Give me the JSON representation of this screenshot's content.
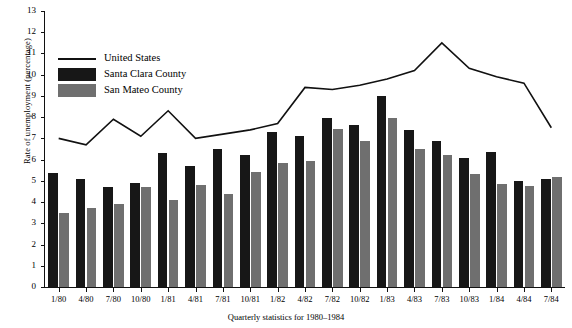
{
  "chart_data": {
    "type": "bar",
    "title": "",
    "xlabel": "Quarterly statistics for 1980–1984",
    "ylabel": "Rate of unemployment (percentage)",
    "ylim": [
      0,
      13
    ],
    "yticks": [
      0,
      1,
      2,
      3,
      4,
      5,
      6,
      7,
      8,
      9,
      10,
      11,
      12,
      13
    ],
    "grid": false,
    "legend_position": "top-left",
    "categories": [
      "1/80",
      "4/80",
      "7/80",
      "10/80",
      "1/81",
      "4/81",
      "7/81",
      "10/81",
      "1/82",
      "4/82",
      "7/82",
      "10/82",
      "1/83",
      "4/83",
      "7/83",
      "10/83",
      "1/84",
      "4/84",
      "7/84"
    ],
    "series": [
      {
        "name": "United States",
        "kind": "line",
        "color": "#111111",
        "values": [
          7.0,
          6.7,
          7.9,
          7.1,
          8.3,
          7.0,
          7.2,
          7.4,
          7.7,
          9.4,
          9.3,
          9.5,
          9.8,
          10.2,
          11.5,
          10.3,
          9.9,
          9.6,
          7.5
        ]
      },
      {
        "name": "Santa Clara County",
        "kind": "bar",
        "color": "#171717",
        "values": [
          5.35,
          5.1,
          4.7,
          4.9,
          6.3,
          5.7,
          6.5,
          6.2,
          7.3,
          7.1,
          7.95,
          7.65,
          9.0,
          7.4,
          6.9,
          6.1,
          6.35,
          5.0,
          5.1
        ]
      },
      {
        "name": "San Mateo County",
        "kind": "bar",
        "color": "#6f6f6f",
        "values": [
          3.5,
          3.7,
          3.9,
          4.7,
          4.1,
          4.8,
          4.4,
          5.4,
          5.85,
          5.95,
          7.45,
          6.9,
          7.95,
          6.5,
          6.2,
          5.3,
          4.85,
          4.75,
          5.2
        ]
      }
    ]
  },
  "legend": {
    "entries": [
      {
        "label": "United States",
        "swatch": "line-swatch"
      },
      {
        "label": "Santa Clara County",
        "swatch": "black-swatch"
      },
      {
        "label": "San Mateo County",
        "swatch": "gray-swatch"
      }
    ]
  },
  "axes": {
    "y_title": "Rate of unemployment (percentage)",
    "x_caption": "Quarterly statistics for 1980–1984"
  }
}
